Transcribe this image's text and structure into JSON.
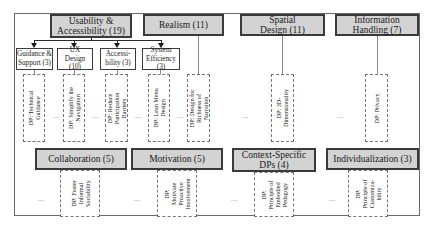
{
  "diagram": {
    "top_categories": [
      {
        "label": "Usability & Accessibility (19)"
      },
      {
        "label": "Realism (11)"
      },
      {
        "label": "Spatial Design (11)"
      },
      {
        "label": "Information Handling (7)"
      }
    ],
    "usability_subcategories": [
      {
        "label": "Guidance & Support (3)"
      },
      {
        "label": "UX Design (10)"
      },
      {
        "label": "Accessi-bility (3)"
      },
      {
        "label": "System Efficiency (3)"
      }
    ],
    "top_design_principles": [
      {
        "label": "DP: Technical\nGuidance"
      },
      {
        "label": "DP: Simplify the\nNavigation"
      },
      {
        "label": "DP: Reduce\nParticipation\nBarriers"
      },
      {
        "label": "DP: Lean Menu\nDesign"
      },
      {
        "label": "DP: Design for\nRichness of\nNarration"
      },
      {
        "label": "DP: 3D-\nDimensionality"
      },
      {
        "label": "DP: Privacy"
      }
    ],
    "bottom_categories": [
      {
        "label": "Collaboration (5)"
      },
      {
        "label": "Motivation (5)"
      },
      {
        "label": "Context-Specific DPs (4)"
      },
      {
        "label": "Individualization (3)"
      }
    ],
    "bottom_design_principles": [
      {
        "label": "DP: Foster\nInformal\nSociability"
      },
      {
        "label": "DP:\nMotivate\nProactive\nInvolvement"
      },
      {
        "label": "DP:\nPrinciple of\nEmbodied\nPedagogy"
      },
      {
        "label": "DP:\nPrinciple of\nCustomiza-\nbility"
      }
    ],
    "ellipsis": "...",
    "colors": {
      "category_fill": "#d3d3d3",
      "category_border": "#3a3a3a",
      "subcategory_fill": "#ffffff",
      "dp_border": "#777777"
    }
  }
}
